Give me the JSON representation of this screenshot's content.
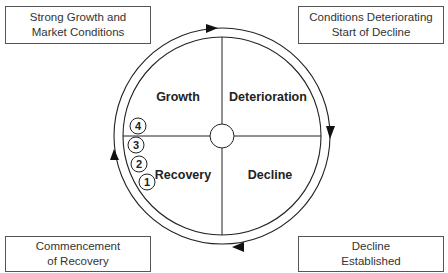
{
  "diagram": {
    "type": "cycle",
    "corner_boxes": {
      "top_left": [
        "Strong Growth and",
        "Market Conditions"
      ],
      "top_right": [
        "Conditions Deteriorating",
        "Start of Decline"
      ],
      "bottom_left": [
        "Commencement",
        "of Recovery"
      ],
      "bottom_right": [
        "Decline",
        "Established"
      ]
    },
    "quadrants": {
      "top_left": "Growth",
      "top_right": "Deterioration",
      "bottom_right": "Decline",
      "bottom_left": "Recovery"
    },
    "stages": [
      "1",
      "2",
      "3",
      "4"
    ],
    "direction": "clockwise",
    "colors": {
      "line": "#222222",
      "box_border": "#555555",
      "background": "#ffffff"
    }
  }
}
